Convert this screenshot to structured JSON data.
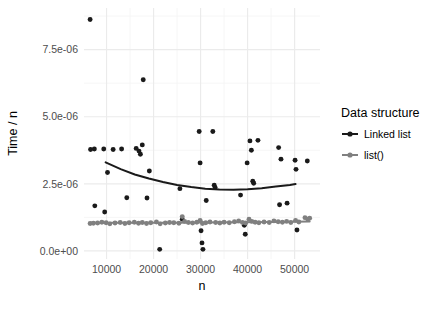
{
  "chart_data": {
    "type": "scatter",
    "title": "",
    "xlabel": "n",
    "ylabel": "Time / n",
    "xlim": [
      5200,
      55400
    ],
    "ylim": [
      -3e-07,
      9.05e-06
    ],
    "grid": true,
    "x_ticks": [
      10000,
      20000,
      30000,
      40000,
      50000
    ],
    "x_tick_labels": [
      "10000",
      "20000",
      "30000",
      "40000",
      "50000"
    ],
    "x_minor_ticks": [
      15000,
      25000,
      35000,
      45000
    ],
    "y_ticks": [
      0.0,
      2.5e-06,
      5e-06,
      7.5e-06
    ],
    "y_tick_labels": [
      "0.0e+00",
      "2.5e-06",
      "5.0e-06",
      "7.5e-06"
    ],
    "y_minor_ticks": [
      1.25e-06,
      3.75e-06,
      6.25e-06,
      8.75e-06
    ],
    "legend": {
      "title": "Data structure",
      "position": "right",
      "entries": [
        {
          "name": "Linked list",
          "color": "#1a1a1a"
        },
        {
          "name": "list()",
          "color": "#808080"
        }
      ]
    },
    "panel_background": "#ffffff",
    "grid_major_color": "#ebebeb",
    "grid_minor_color": "#f5f5f5",
    "series": [
      {
        "name": "Linked list",
        "color": "#1a1a1a",
        "marker": "circle",
        "points": [
          [
            6500,
            8.62e-06
          ],
          [
            6600,
            3.78e-06
          ],
          [
            7400,
            3.8e-06
          ],
          [
            7500,
            1.68e-06
          ],
          [
            9400,
            3.8e-06
          ],
          [
            9600,
            1.45e-06
          ],
          [
            10200,
            2.92e-06
          ],
          [
            11400,
            3.78e-06
          ],
          [
            13200,
            3.8e-06
          ],
          [
            14300,
            1.98e-06
          ],
          [
            16300,
            3.82e-06
          ],
          [
            16900,
            3.72e-06
          ],
          [
            17200,
            3.6e-06
          ],
          [
            17600,
            3.95e-06
          ],
          [
            17800,
            6.38e-06
          ],
          [
            18600,
            1.97e-06
          ],
          [
            19100,
            2.98e-06
          ],
          [
            21300,
            6e-08
          ],
          [
            25600,
            2.32e-06
          ],
          [
            26100,
            1.18e-06
          ],
          [
            29700,
            4.45e-06
          ],
          [
            29900,
            3.28e-06
          ],
          [
            30100,
            7.5e-07
          ],
          [
            30300,
            3e-07
          ],
          [
            30500,
            6e-08
          ],
          [
            31200,
            1.88e-06
          ],
          [
            32600,
            4.45e-06
          ],
          [
            32900,
            2.45e-06
          ],
          [
            33100,
            2.36e-06
          ],
          [
            38500,
            2.08e-06
          ],
          [
            39300,
            9.6e-07
          ],
          [
            39500,
            6.2e-07
          ],
          [
            39900,
            3.28e-06
          ],
          [
            40500,
            4.1e-06
          ],
          [
            40800,
            3.75e-06
          ],
          [
            41100,
            2.6e-06
          ],
          [
            41300,
            2.52e-06
          ],
          [
            42200,
            4.12e-06
          ],
          [
            46600,
            3.85e-06
          ],
          [
            46800,
            1.72e-06
          ],
          [
            47100,
            3.42e-06
          ],
          [
            48400,
            1.78e-06
          ],
          [
            50100,
            3.38e-06
          ],
          [
            50300,
            3.04e-06
          ],
          [
            50500,
            7.8e-07
          ],
          [
            52700,
            3.35e-06
          ]
        ],
        "trend": [
          [
            9800,
            3.3e-06
          ],
          [
            13000,
            3.05e-06
          ],
          [
            16000,
            2.85e-06
          ],
          [
            19000,
            2.7e-06
          ],
          [
            22000,
            2.57e-06
          ],
          [
            25000,
            2.46e-06
          ],
          [
            28000,
            2.38e-06
          ],
          [
            31000,
            2.32e-06
          ],
          [
            34000,
            2.29e-06
          ],
          [
            37000,
            2.28e-06
          ],
          [
            40000,
            2.3e-06
          ],
          [
            43000,
            2.34e-06
          ],
          [
            46000,
            2.4e-06
          ],
          [
            49000,
            2.46e-06
          ],
          [
            50200,
            2.49e-06
          ]
        ]
      },
      {
        "name": "list()",
        "color": "#808080",
        "marker": "circle",
        "points": [
          [
            6500,
            1.02e-06
          ],
          [
            7200,
            1.03e-06
          ],
          [
            8100,
            1.04e-06
          ],
          [
            9000,
            1.07e-06
          ],
          [
            9900,
            1.05e-06
          ],
          [
            10700,
            1.01e-06
          ],
          [
            11800,
            1.04e-06
          ],
          [
            12900,
            1.06e-06
          ],
          [
            13900,
            1.02e-06
          ],
          [
            14800,
            1.05e-06
          ],
          [
            15900,
            1.07e-06
          ],
          [
            16800,
            1.03e-06
          ],
          [
            17600,
            1.06e-06
          ],
          [
            18500,
            1.02e-06
          ],
          [
            19400,
            1.05e-06
          ],
          [
            20600,
            1.08e-06
          ],
          [
            21400,
            1.01e-06
          ],
          [
            22500,
            1.04e-06
          ],
          [
            23400,
            1.06e-06
          ],
          [
            24300,
            1.05e-06
          ],
          [
            25400,
            1.03e-06
          ],
          [
            26100,
            1.28e-06
          ],
          [
            26600,
            1.1e-06
          ],
          [
            27400,
            1.06e-06
          ],
          [
            28300,
            1.04e-06
          ],
          [
            29200,
            1.07e-06
          ],
          [
            29900,
            1.14e-06
          ],
          [
            30400,
            1.02e-06
          ],
          [
            31100,
            1.05e-06
          ],
          [
            32000,
            1.08e-06
          ],
          [
            33200,
            1.06e-06
          ],
          [
            34100,
            1.04e-06
          ],
          [
            35000,
            1.07e-06
          ],
          [
            36100,
            1.05e-06
          ],
          [
            37200,
            1.09e-06
          ],
          [
            38100,
            1.12e-06
          ],
          [
            38900,
            1.06e-06
          ],
          [
            39600,
            1.04e-06
          ],
          [
            40300,
            1.18e-06
          ],
          [
            40900,
            1.1e-06
          ],
          [
            41600,
            1.07e-06
          ],
          [
            42400,
            1.05e-06
          ],
          [
            43500,
            1.08e-06
          ],
          [
            44600,
            1.06e-06
          ],
          [
            45600,
            1.12e-06
          ],
          [
            46500,
            1.09e-06
          ],
          [
            47400,
            1.07e-06
          ],
          [
            48300,
            1.1e-06
          ],
          [
            49200,
            1.06e-06
          ],
          [
            50200,
            1.14e-06
          ],
          [
            50900,
            1.08e-06
          ],
          [
            52200,
            1.24e-06
          ],
          [
            52800,
            1.18e-06
          ],
          [
            53200,
            1.22e-06
          ]
        ],
        "trend": [
          [
            6500,
            1.05e-06
          ],
          [
            14000,
            1.05e-06
          ],
          [
            22000,
            1.05e-06
          ],
          [
            30000,
            1.06e-06
          ],
          [
            38000,
            1.07e-06
          ],
          [
            46000,
            1.08e-06
          ],
          [
            53200,
            1.1e-06
          ]
        ]
      }
    ]
  }
}
